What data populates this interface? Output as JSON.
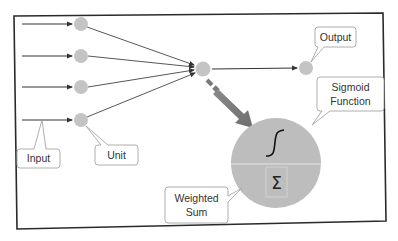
{
  "diagram": {
    "colors": {
      "frame": "#2a2a2a",
      "node": "#c4c4c4",
      "big_node": "#bdbdbd",
      "edge": "#333333",
      "big_arrow": "#7a7a7a",
      "callout_border": "#9a9a9a",
      "callout_fill": "#ffffff",
      "text": "#333333"
    },
    "nodes": [
      {
        "id": "input-1",
        "role": "input unit"
      },
      {
        "id": "input-2",
        "role": "input unit"
      },
      {
        "id": "input-3",
        "role": "input unit"
      },
      {
        "id": "input-4",
        "role": "input unit"
      },
      {
        "id": "hidden",
        "role": "neuron"
      },
      {
        "id": "output",
        "role": "output"
      }
    ],
    "callouts": {
      "input": "Input",
      "unit": "Unit",
      "output": "Output",
      "sigmoid_line1": "Sigmoid",
      "sigmoid_line2": "Function",
      "weighted_line1": "Weighted",
      "weighted_line2": "Sum"
    },
    "neuron_detail": {
      "top_symbol": "sigmoid-curve",
      "bottom_symbol": "Σ"
    }
  }
}
